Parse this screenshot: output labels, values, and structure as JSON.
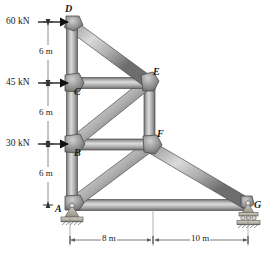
{
  "figure": {
    "type": "truss-free-body-diagram",
    "nodes": [
      {
        "id": "A",
        "label": "A",
        "x": 72,
        "y": 205,
        "label_x": 59,
        "label_y": 205,
        "support": "pin"
      },
      {
        "id": "B",
        "label": "B",
        "x": 72,
        "y": 144,
        "label_x": 76,
        "label_y": 155,
        "support": "none"
      },
      {
        "id": "C",
        "label": "C",
        "x": 72,
        "y": 83,
        "label_x": 76,
        "label_y": 94,
        "support": "none"
      },
      {
        "id": "D",
        "label": "D",
        "x": 72,
        "y": 22,
        "label_x": 68,
        "label_y": 11,
        "support": "none"
      },
      {
        "id": "E",
        "label": "E",
        "x": 149,
        "y": 83,
        "label_x": 155,
        "label_y": 73,
        "support": "none"
      },
      {
        "id": "F",
        "label": "F",
        "x": 152,
        "y": 145,
        "label_x": 159,
        "label_y": 135,
        "support": "none"
      },
      {
        "id": "G",
        "label": "G",
        "x": 248,
        "y": 205,
        "label_x": 255,
        "label_y": 205,
        "support": "roller"
      }
    ],
    "members": [
      {
        "from": "D",
        "to": "C"
      },
      {
        "from": "C",
        "to": "B"
      },
      {
        "from": "B",
        "to": "A"
      },
      {
        "from": "D",
        "to": "E"
      },
      {
        "from": "C",
        "to": "E"
      },
      {
        "from": "B",
        "to": "E"
      },
      {
        "from": "E",
        "to": "F"
      },
      {
        "from": "B",
        "to": "F"
      },
      {
        "from": "A",
        "to": "F"
      },
      {
        "from": "F",
        "to": "G"
      },
      {
        "from": "A",
        "to": "G"
      }
    ],
    "loads": [
      {
        "label": "60 kN",
        "magnitude": 60,
        "unit": "kN",
        "at_node": "D",
        "direction": "right",
        "label_x": 9,
        "label_y": 22,
        "arrow_x1": 38,
        "arrow_x2": 69,
        "arrow_y": 22
      },
      {
        "label": "45 kN",
        "magnitude": 45,
        "unit": "kN",
        "at_node": "C",
        "direction": "right",
        "label_x": 9,
        "label_y": 83,
        "arrow_x1": 38,
        "arrow_x2": 69,
        "arrow_y": 83
      },
      {
        "label": "30 kN",
        "magnitude": 30,
        "unit": "kN",
        "at_node": "B",
        "direction": "right",
        "label_x": 9,
        "label_y": 144,
        "arrow_x1": 38,
        "arrow_x2": 69,
        "arrow_y": 144
      }
    ],
    "vertical_dimensions": [
      {
        "label": "6 m",
        "value": 6,
        "unit": "m",
        "from": "D",
        "to": "C",
        "x": 48,
        "y": 52
      },
      {
        "label": "6 m",
        "value": 6,
        "unit": "m",
        "from": "C",
        "to": "B",
        "x": 48,
        "y": 113
      },
      {
        "label": "6 m",
        "value": 6,
        "unit": "m",
        "from": "B",
        "to": "A",
        "x": 48,
        "y": 174
      }
    ],
    "horizontal_dimensions": [
      {
        "label": "8 m",
        "value": 8,
        "unit": "m",
        "x1": 70,
        "x2": 152,
        "y": 240,
        "label_x": 111
      },
      {
        "label": "10 m",
        "value": 10,
        "unit": "m",
        "x1": 154,
        "x2": 248,
        "y": 240,
        "label_x": 201
      }
    ],
    "colors": {
      "member_dark": "#6e6e6e",
      "member_light": "#d8d8d8",
      "member_mid": "#9a9a9a",
      "gusset": "#8c8c8c",
      "gusset_light": "#c4c4c4",
      "outline": "#4a4a4a",
      "support": "#b5b1a8",
      "hatch": "#7a7a7a",
      "dim_line": "#6a6a6a",
      "text": "#1a1a1a"
    }
  }
}
